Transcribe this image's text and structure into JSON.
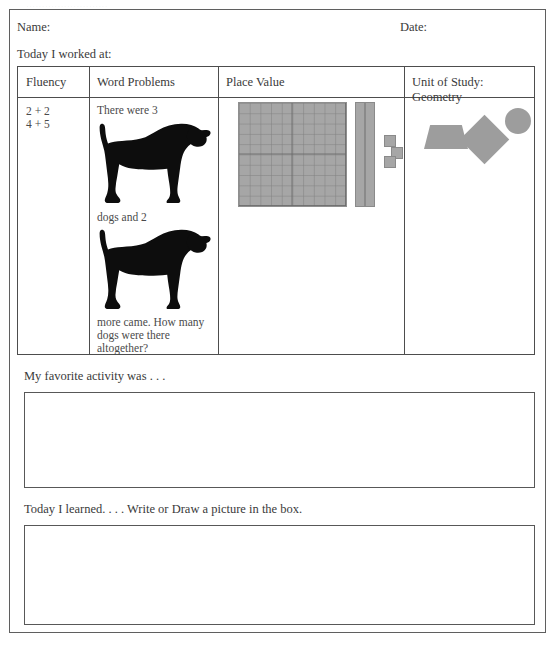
{
  "document": {
    "scan_artifact_text": "..........................",
    "header": {
      "name_label": "Name:",
      "date_label": "Date:",
      "worked_at_label": "Today I worked at:"
    },
    "table": {
      "columns": [
        {
          "key": "fluency",
          "header": "Fluency"
        },
        {
          "key": "word_problems",
          "header": "Word Problems"
        },
        {
          "key": "place_value",
          "header": "Place Value"
        },
        {
          "key": "unit_of_study",
          "header": "Unit of Study:\nGeometry"
        }
      ],
      "cells": {
        "fluency": {
          "problems": [
            "2 + 2",
            "4 + 5"
          ],
          "text": "2 + 2\n4 + 5"
        },
        "word_problems": {
          "line_1": "There were 3",
          "line_2": "dogs and 2",
          "line_3": "more came. How many dogs were there altogether?",
          "image_1": "dog-silhouette",
          "image_2": "dog-silhouette"
        },
        "place_value": {
          "hundreds_flats": 1,
          "tens_rods": 2,
          "ones_cubes": 3,
          "block_color": "#a6a6a6"
        },
        "unit_of_study": {
          "shapes": [
            "trapezoid",
            "diamond",
            "circle"
          ],
          "shape_color": "#9d9d9d"
        }
      }
    },
    "reflection": {
      "prompt_1": "My favorite activity was . . .",
      "prompt_2": "Today I learned. . . . Write or Draw a picture in the box.",
      "answer_1": "",
      "answer_2": ""
    },
    "colors": {
      "border": "#4d4d4d",
      "page_border": "#5f5f5f",
      "text": "#3a3a3a",
      "silhouette": "#000000"
    }
  }
}
